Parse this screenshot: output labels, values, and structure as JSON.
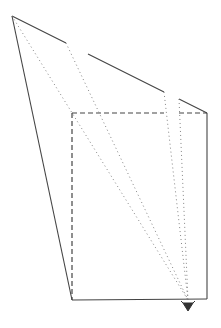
{
  "diagram": {
    "colors": {
      "line": "#444444",
      "sight_line": "#777777",
      "background": "#ffffff"
    },
    "panel_outline": {
      "top_left": [
        12,
        16
      ],
      "bottom_left": [
        72,
        300
      ],
      "top_segments": [
        {
          "from": [
            12,
            16
          ],
          "to": [
            66,
            43
          ]
        },
        {
          "from": [
            88,
            54
          ],
          "to": [
            164,
            92
          ]
        },
        {
          "from": [
            179,
            99
          ],
          "to": [
            207,
            113
          ]
        }
      ]
    },
    "box": {
      "top_left": [
        72,
        113
      ],
      "top_right": [
        207,
        113
      ],
      "bottom_right": [
        207,
        299
      ],
      "bottom_left": [
        72,
        300
      ],
      "hidden_edges": [
        "top",
        "left"
      ]
    },
    "eye": {
      "position": [
        188,
        306
      ],
      "symbol": "eye-observer-icon"
    },
    "sight_lines": [
      {
        "from": [
          12,
          16
        ],
        "to": [
          188,
          300
        ]
      },
      {
        "from": [
          66,
          43
        ],
        "to": [
          188,
          300
        ]
      },
      {
        "from": [
          164,
          92
        ],
        "to": [
          188,
          300
        ]
      },
      {
        "from": [
          179,
          99
        ],
        "to": [
          188,
          300
        ]
      }
    ]
  }
}
